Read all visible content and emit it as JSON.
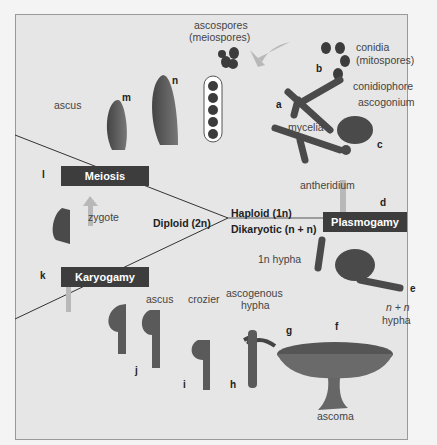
{
  "diagram": {
    "processes": {
      "meiosis": "Meiosis",
      "plasmogamy": "Plasmogamy",
      "karyogamy": "Karyogamy"
    },
    "phases": {
      "haploid": "Haploid (1n)",
      "dikaryotic": "Dikaryotic (n + n)",
      "diploid": "Diploid (2n)"
    },
    "labels": {
      "ascospores": "ascospores",
      "meiospores": "(meiospores)",
      "conidia": "conidia",
      "mitospores": "(mitospores)",
      "conidiophore": "conidiophore",
      "ascogonium": "ascogonium",
      "mycelia": "mycelia",
      "antheridium": "antheridium",
      "hypha_1n": "1n hypha",
      "hypha_nn_1": "n + n",
      "hypha_nn_2": "hypha",
      "ascogenous_1": "ascogenous",
      "ascogenous_2": "hypha",
      "ascoma": "ascoma",
      "crozier": "crozier",
      "ascus_bottom": "ascus",
      "ascus_top": "ascus",
      "zygote": "zygote"
    },
    "steps": [
      "a",
      "b",
      "c",
      "d",
      "e",
      "f",
      "g",
      "h",
      "i",
      "j",
      "k",
      "l",
      "m",
      "n"
    ],
    "colors": {
      "background": "#e6e6e6",
      "box": "#3d3d3d",
      "structure": "#5a5a5a",
      "arrow": "#b8b8b8"
    }
  }
}
